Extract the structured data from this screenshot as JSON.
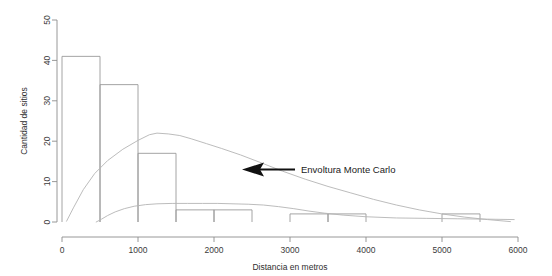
{
  "chart_data": {
    "type": "bar",
    "title": "",
    "subtitle": "",
    "xlabel": "Distancia en metros",
    "ylabel": "Cantidad de sitios",
    "xlim": [
      0,
      6000
    ],
    "ylim": [
      0,
      50
    ],
    "xticks": [
      0,
      1000,
      2000,
      3000,
      4000,
      5000,
      6000
    ],
    "xtick_labels": [
      "0",
      "1000",
      "2000",
      "3000",
      "4000",
      "5000",
      "6000"
    ],
    "yticks": [
      0,
      10,
      20,
      30,
      40,
      50
    ],
    "ytick_labels": [
      "0",
      "10",
      "20",
      "30",
      "40",
      "50"
    ],
    "grid": false,
    "legend": "none",
    "bin_width": 500,
    "bin_edges": [
      0,
      500,
      1000,
      1500,
      2000,
      2500,
      3000,
      3500,
      4000,
      4500,
      5000,
      5500,
      6000
    ],
    "categories": [
      "0-500",
      "500-1000",
      "1000-1500",
      "1500-2000",
      "2000-2500",
      "2500-3000",
      "3000-3500",
      "3500-4000",
      "4000-4500",
      "4500-5000",
      "5000-5500",
      "5500-6000"
    ],
    "values": [
      41,
      34,
      17,
      3,
      3,
      0,
      2,
      2,
      0,
      0,
      2,
      0
    ],
    "series": [
      {
        "name": "Histograma de sitios",
        "type": "bar",
        "values": [
          41,
          34,
          17,
          3,
          3,
          0,
          2,
          2,
          0,
          0,
          2,
          0
        ]
      },
      {
        "name": "Envoltura Monte Carlo superior",
        "type": "line",
        "x": [
          60,
          150,
          280,
          430,
          600,
          800,
          1000,
          1150,
          1250,
          1400,
          1550,
          1700,
          1900,
          2100,
          2350,
          2600,
          2900,
          3200,
          3500,
          3800,
          4100,
          4400,
          4700,
          5000,
          5300,
          5600,
          5900
        ],
        "y": [
          0.2,
          3.5,
          8.0,
          12.0,
          15.2,
          18.0,
          20.2,
          21.6,
          22.0,
          21.8,
          21.4,
          20.6,
          19.4,
          18.2,
          16.6,
          14.8,
          12.6,
          10.6,
          8.8,
          7.2,
          5.6,
          4.2,
          3.0,
          2.0,
          1.2,
          0.6,
          0.1
        ]
      },
      {
        "name": "Envoltura Monte Carlo inferior",
        "type": "line",
        "x": [
          450,
          520,
          600,
          700,
          820,
          950,
          1100,
          1250,
          1450,
          1650,
          1850,
          2050,
          2250,
          2450,
          2650,
          2850,
          3050,
          3250,
          3450,
          3700,
          4000,
          4400,
          4800,
          5200,
          5600,
          5950
        ],
        "y": [
          0.0,
          0.7,
          1.6,
          2.5,
          3.3,
          3.9,
          4.3,
          4.5,
          4.6,
          4.6,
          4.6,
          4.6,
          4.5,
          4.4,
          4.2,
          3.8,
          3.3,
          2.7,
          2.2,
          1.7,
          1.3,
          1.0,
          0.9,
          0.8,
          0.7,
          0.6
        ]
      }
    ],
    "annotations": [
      {
        "text": "Envoltura Monte Carlo",
        "arrow": "left-pointing",
        "points_to_series": "Envoltura Monte Carlo superior"
      }
    ]
  }
}
